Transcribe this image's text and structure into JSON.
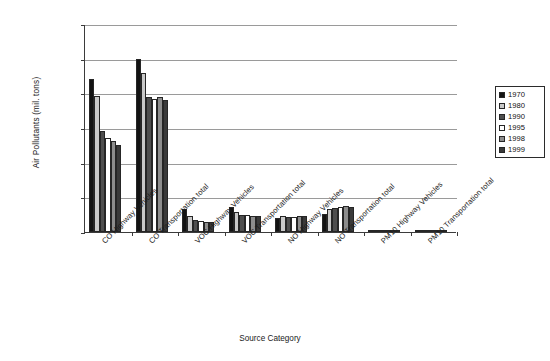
{
  "chart_data": {
    "type": "bar",
    "title": "",
    "xlabel": "Source Category",
    "ylabel": "Air Pollutants (mil. tons)",
    "ylim": [
      0,
      120
    ],
    "ytick_step": 20,
    "ytick_labels": [
      "0.00",
      "20.00",
      "40.00",
      "60.00",
      "80.00",
      "100.00",
      "120.00"
    ],
    "grid": true,
    "legend_position": "right",
    "categories": [
      "CO Highway Vehicles",
      "CO Transportation total",
      "VOC Highway Vehicles",
      "VOC Transportation total",
      "NO Highway Vehicles",
      "NO Transportation total",
      "PM10 Highway Vehicles",
      "PM10 Transportation total"
    ],
    "series": [
      {
        "name": "1970",
        "color": "#131313",
        "values": [
          88.0,
          100.0,
          13.0,
          14.6,
          8.0,
          10.5,
          0.5,
          1.0
        ]
      },
      {
        "name": "1980",
        "color": "#c9c9c9",
        "values": [
          78.5,
          92.0,
          9.5,
          11.5,
          9.5,
          13.0,
          0.5,
          1.2
        ]
      },
      {
        "name": "1990",
        "color": "#4e4e4e",
        "values": [
          58.0,
          78.0,
          7.0,
          9.8,
          8.5,
          14.0,
          0.4,
          1.2
        ]
      },
      {
        "name": "1995",
        "color": "#ffffff",
        "values": [
          54.5,
          77.0,
          6.3,
          9.8,
          8.5,
          14.5,
          0.3,
          1.2
        ]
      },
      {
        "name": "1998",
        "color": "#8d8d8d",
        "values": [
          52.5,
          78.0,
          6.0,
          9.5,
          9.0,
          15.0,
          0.3,
          1.2
        ]
      },
      {
        "name": "1999",
        "color": "#3a3a3a",
        "values": [
          50.0,
          76.0,
          5.6,
          9.5,
          9.0,
          14.5,
          0.3,
          1.2
        ]
      }
    ]
  }
}
